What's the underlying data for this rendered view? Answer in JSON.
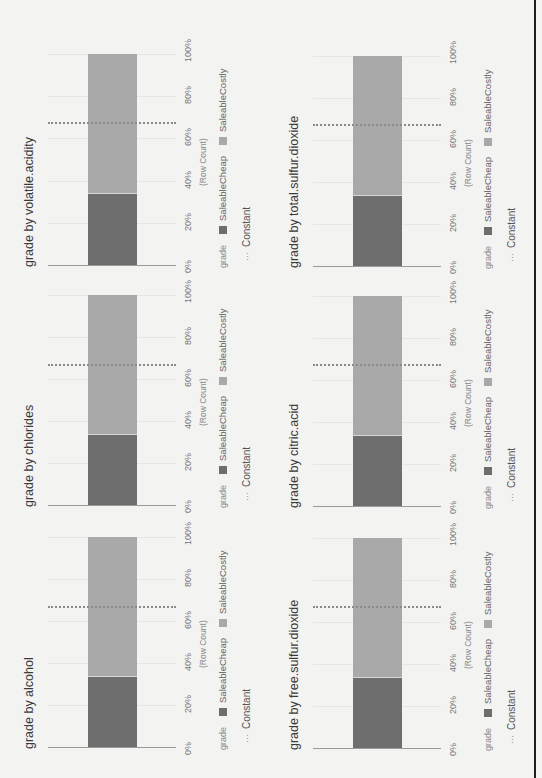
{
  "page": {
    "orientation": "rotated 90deg counter-clockwise",
    "colors": {
      "background": "#f3f3f1",
      "saleable_cheap": "#6e6e6e",
      "saleable_costly": "#a9a9a9",
      "constant_line": "#8a8a8a",
      "axis": "#9a9a9a",
      "frame_line": "#1e1e1e"
    }
  },
  "common": {
    "x_ticks": [
      "0%",
      "20%",
      "40%",
      "60%",
      "80%",
      "100%"
    ],
    "x_axis_title": "(Row Count)",
    "legend_title": "grade",
    "legend_items": [
      {
        "label": "SaleableCheap",
        "color": "#6e6e6e"
      },
      {
        "label": "SaleableCostly",
        "color": "#a9a9a9"
      }
    ],
    "constant_marker": "···",
    "constant_label": "Constant"
  },
  "charts": [
    {
      "title": "grade by volatile.acidity",
      "cheap": 33.5,
      "costly": 66.5,
      "constant": 67.5
    },
    {
      "title": "grade by total.sulfur.dioxide",
      "cheap": 33.5,
      "costly": 66.5,
      "constant": 67
    },
    {
      "title": "grade by chlorides",
      "cheap": 33.5,
      "costly": 66.5,
      "constant": 66.5
    },
    {
      "title": "grade by citric.acid",
      "cheap": 33.5,
      "costly": 66.5,
      "constant": 67
    },
    {
      "title": "grade by alcohol",
      "cheap": 33.5,
      "costly": 66.5,
      "constant": 66.5
    },
    {
      "title": "grade by free.sulfur.dioxide",
      "cheap": 33.5,
      "costly": 66.5,
      "constant": 67
    }
  ],
  "chart_data": [
    {
      "type": "bar",
      "orientation": "horizontal stacked 100%",
      "title": "grade by volatile.acidity",
      "categories": [
        ""
      ],
      "series": [
        {
          "name": "SaleableCheap",
          "values": [
            33.5
          ]
        },
        {
          "name": "SaleableCostly",
          "values": [
            66.5
          ]
        }
      ],
      "reference_line": {
        "name": "Constant",
        "value": 67.5
      },
      "xlabel": "(Row Count)",
      "xticks": [
        "0%",
        "20%",
        "40%",
        "60%",
        "80%",
        "100%"
      ],
      "xlim": [
        0,
        100
      ],
      "legend_title": "grade",
      "legend_position": "bottom"
    },
    {
      "type": "bar",
      "orientation": "horizontal stacked 100%",
      "title": "grade by total.sulfur.dioxide",
      "categories": [
        ""
      ],
      "series": [
        {
          "name": "SaleableCheap",
          "values": [
            33.5
          ]
        },
        {
          "name": "SaleableCostly",
          "values": [
            66.5
          ]
        }
      ],
      "reference_line": {
        "name": "Constant",
        "value": 67
      },
      "xlabel": "(Row Count)",
      "xticks": [
        "0%",
        "20%",
        "40%",
        "60%",
        "80%",
        "100%"
      ],
      "xlim": [
        0,
        100
      ],
      "legend_title": "grade",
      "legend_position": "bottom"
    },
    {
      "type": "bar",
      "orientation": "horizontal stacked 100%",
      "title": "grade by chlorides",
      "categories": [
        ""
      ],
      "series": [
        {
          "name": "SaleableCheap",
          "values": [
            33.5
          ]
        },
        {
          "name": "SaleableCostly",
          "values": [
            66.5
          ]
        }
      ],
      "reference_line": {
        "name": "Constant",
        "value": 66.5
      },
      "xlabel": "(Row Count)",
      "xticks": [
        "0%",
        "20%",
        "40%",
        "60%",
        "80%",
        "100%"
      ],
      "xlim": [
        0,
        100
      ],
      "legend_title": "grade",
      "legend_position": "bottom"
    },
    {
      "type": "bar",
      "orientation": "horizontal stacked 100%",
      "title": "grade by citric.acid",
      "categories": [
        ""
      ],
      "series": [
        {
          "name": "SaleableCheap",
          "values": [
            33.5
          ]
        },
        {
          "name": "SaleableCostly",
          "values": [
            66.5
          ]
        }
      ],
      "reference_line": {
        "name": "Constant",
        "value": 67
      },
      "xlabel": "(Row Count)",
      "xticks": [
        "0%",
        "20%",
        "40%",
        "60%",
        "80%",
        "100%"
      ],
      "xlim": [
        0,
        100
      ],
      "legend_title": "grade",
      "legend_position": "bottom"
    },
    {
      "type": "bar",
      "orientation": "horizontal stacked 100%",
      "title": "grade by alcohol",
      "categories": [
        ""
      ],
      "series": [
        {
          "name": "SaleableCheap",
          "values": [
            33.5
          ]
        },
        {
          "name": "SaleableCostly",
          "values": [
            66.5
          ]
        }
      ],
      "reference_line": {
        "name": "Constant",
        "value": 66.5
      },
      "xlabel": "(Row Count)",
      "xticks": [
        "0%",
        "20%",
        "40%",
        "60%",
        "80%",
        "100%"
      ],
      "xlim": [
        0,
        100
      ],
      "legend_title": "grade",
      "legend_position": "bottom"
    },
    {
      "type": "bar",
      "orientation": "horizontal stacked 100%",
      "title": "grade by free.sulfur.dioxide",
      "categories": [
        ""
      ],
      "series": [
        {
          "name": "SaleableCheap",
          "values": [
            33.5
          ]
        },
        {
          "name": "SaleableCostly",
          "values": [
            66.5
          ]
        }
      ],
      "reference_line": {
        "name": "Constant",
        "value": 67
      },
      "xlabel": "(Row Count)",
      "xticks": [
        "0%",
        "20%",
        "40%",
        "60%",
        "80%",
        "100%"
      ],
      "xlim": [
        0,
        100
      ],
      "legend_title": "grade",
      "legend_position": "bottom"
    }
  ]
}
